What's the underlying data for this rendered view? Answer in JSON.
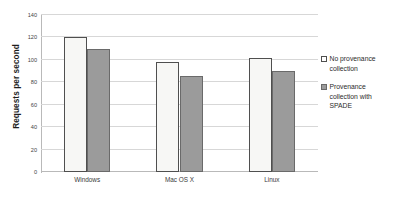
{
  "chart_data": {
    "type": "bar",
    "title": "",
    "xlabel": "",
    "ylabel": "Requests per second",
    "categories": [
      "Windows",
      "Mac OS X",
      "Linux"
    ],
    "series": [
      {
        "name": "No provenance collection",
        "values": [
          120,
          98,
          102
        ],
        "color": "#f7f7f5",
        "border_color": "#4f4f4f",
        "marker": "white-square"
      },
      {
        "name": "Provenance collection with SPADE",
        "values": [
          110,
          86,
          90
        ],
        "color": "#9b9b9b",
        "border_color": "#6a6a6a",
        "marker": "gray-square"
      }
    ],
    "ylim": [
      0,
      140
    ],
    "yticks": [
      0,
      20,
      40,
      60,
      80,
      100,
      120,
      140
    ],
    "ytick_labels": [
      "0",
      "20",
      "40",
      "60",
      "80",
      "100",
      "120",
      "140"
    ],
    "grid": "horizontal",
    "legend_position": "right",
    "legend_entries": [
      "No provenance collection",
      "Provenance collection with SPADE"
    ]
  }
}
